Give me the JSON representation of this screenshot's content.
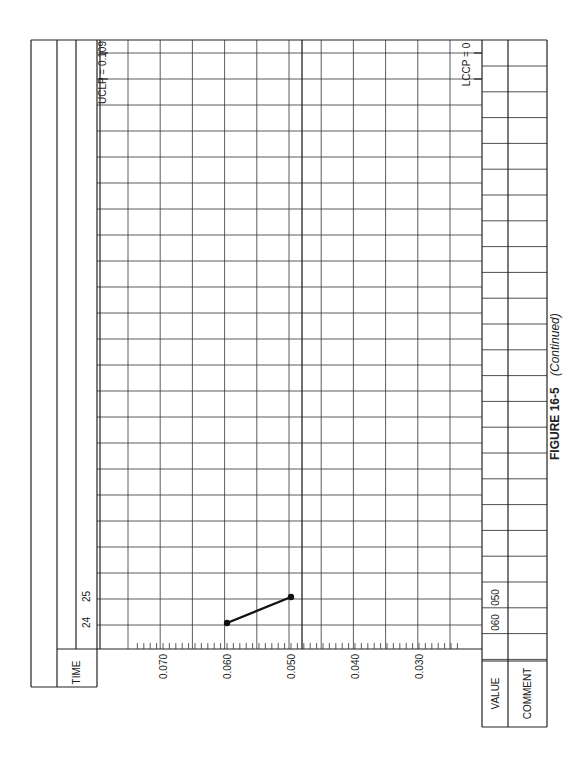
{
  "caption": {
    "figure": "FIGURE 16-5",
    "note": "(Continued)"
  },
  "labels": {
    "time": "TIME",
    "value": "VALUE",
    "comment": "COMMENT",
    "ucl": "UCLP = 0.109",
    "lcl": "LCCP = 0"
  },
  "chart_data": {
    "type": "line",
    "orientation": "rotated 90° (time runs vertically upward, value axis horizontal)",
    "xlabel": "TIME",
    "ylabel": "VALUE",
    "value_axis": {
      "ticks": [
        0.07,
        0.06,
        0.05,
        0.04,
        0.03
      ],
      "tick_labels": [
        "0.070",
        "0.060",
        "0.050",
        "0.040",
        "0.030"
      ],
      "minor_tick_step": 0.001,
      "range": [
        0.109,
        0.0
      ]
    },
    "control_limits": {
      "UCL": 0.109,
      "LCL": 0
    },
    "x": [
      24,
      25
    ],
    "series": [
      {
        "name": "p",
        "values": [
          0.06,
          0.05
        ]
      }
    ],
    "value_row_entries": [
      "060",
      "050"
    ],
    "grid": true
  }
}
